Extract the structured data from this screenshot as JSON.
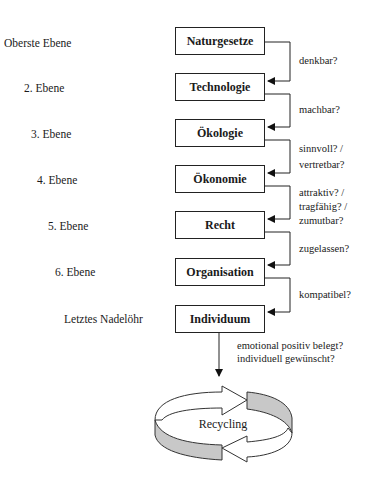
{
  "levels": [
    {
      "label": "Oberste Ebene",
      "box": "Naturgesetze"
    },
    {
      "label": "2. Ebene",
      "box": "Technologie"
    },
    {
      "label": "3. Ebene",
      "box": "Ökologie"
    },
    {
      "label": "4. Ebene",
      "box": "Ökonomie"
    },
    {
      "label": "5. Ebene",
      "box": "Recht"
    },
    {
      "label": "6. Ebene",
      "box": "Organisation"
    },
    {
      "label": "Letztes Nadelöhr",
      "box": "Individuum"
    }
  ],
  "questions": [
    [
      "denkbar?"
    ],
    [
      "machbar?"
    ],
    [
      "sinnvoll? /",
      "vertretbar?"
    ],
    [
      "attraktiv? /",
      "tragfähig? /",
      "zumutbar?"
    ],
    [
      "zugelassen?"
    ],
    [
      "kompatibel?"
    ]
  ],
  "final_question": [
    "emotional positiv belegt?",
    "individuell gewünscht?"
  ],
  "cycle": {
    "label": "Recycling",
    "fill_color": "#c8c8c8"
  }
}
